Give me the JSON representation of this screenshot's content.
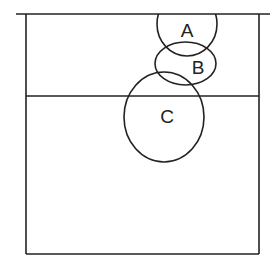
{
  "diagram": {
    "type": "venn-with-regions",
    "stroke_color": "#222222",
    "background": "#ffffff",
    "labels": {
      "a": "A",
      "b": "B",
      "c": "C"
    }
  }
}
